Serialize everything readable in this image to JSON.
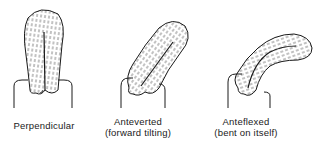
{
  "figures": [
    {
      "id": "perpendicular",
      "label_line1": "Perpendicular",
      "label_line2": ""
    },
    {
      "id": "anteverted",
      "label_line1": "Anteverted",
      "label_line2": "(forward tilting)"
    },
    {
      "id": "anteflexed",
      "label_line1": "Anteflexed",
      "label_line2": "(bent on itself)"
    }
  ],
  "colors": {
    "ink": "#1a1a1a",
    "background": "#ffffff"
  }
}
